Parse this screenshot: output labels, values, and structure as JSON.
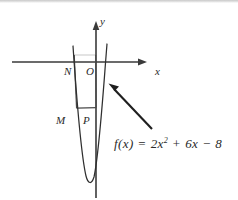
{
  "figure": {
    "kind": "math-graph",
    "background_color": "#ffffff",
    "ink_color": "#2b2b2b"
  },
  "axes": {
    "x_label": "x",
    "y_label": "y",
    "x_axis": {
      "x1": 12,
      "y1": 62,
      "x2": 147,
      "y2": 62
    },
    "y_axis": {
      "x1": 96,
      "y1": 22,
      "x2": 96,
      "y2": 198
    },
    "origin": {
      "x": 96,
      "y": 62
    }
  },
  "points": [
    {
      "id": "N",
      "label": "N",
      "label_x": 64,
      "label_y": 66,
      "x": 75,
      "y": 62
    },
    {
      "id": "O",
      "label": "O",
      "label_x": 86,
      "label_y": 66,
      "x": 96,
      "y": 62
    },
    {
      "id": "M",
      "label": "M",
      "label_x": 57,
      "label_y": 117,
      "x": 75,
      "y": 108
    },
    {
      "id": "P",
      "label": "P",
      "label_x": 83,
      "label_y": 117,
      "x": 96,
      "y": 108
    }
  ],
  "rectangle": {
    "name": "MNOP",
    "left": 75,
    "right": 96,
    "top": 55,
    "bottom": 108
  },
  "curve": {
    "name": "parabola",
    "equation_text": "f(x) = 2x² + 6x − 8",
    "vertex": {
      "x": 90,
      "y": 182
    },
    "left_top": {
      "x": 73,
      "y": 46
    },
    "right_top": {
      "x": 107,
      "y": 44
    }
  },
  "equation": {
    "f_of_x": "f(x)",
    "equals": " = ",
    "term1_coeff": "2",
    "term1_var": "x",
    "term1_exp": "2",
    "op1": " + ",
    "term2": "6x",
    "op2": " − ",
    "term3": "8"
  },
  "annotation_arrow": {
    "name": "equation-pointer",
    "from": {
      "x": 152,
      "y": 129
    },
    "to": {
      "x": 109,
      "y": 84
    }
  }
}
